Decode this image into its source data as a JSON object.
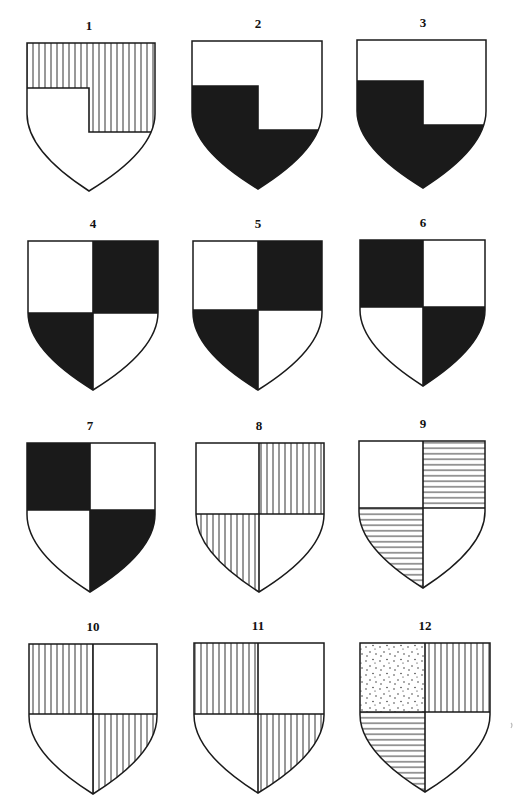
{
  "plate": {
    "ink": "#1a1a1a",
    "paper": "#ffffff",
    "figures": [
      {
        "label": "1",
        "x": 27,
        "y": 43,
        "w": 128,
        "tip": 191,
        "type": "quarter-step",
        "split_x": 89,
        "split_y": 88,
        "step_y": 132,
        "fills": {
          "top": "vertical",
          "bottom": "plain"
        }
      },
      {
        "label": "2",
        "x": 192,
        "y": 41,
        "w": 130,
        "tip": 189,
        "type": "quarter-step",
        "split_x": 258,
        "split_y": 86,
        "step_y": 130,
        "fills": {
          "top": "plain",
          "bottom": "black"
        }
      },
      {
        "label": "3",
        "x": 357,
        "y": 40,
        "w": 129,
        "tip": 188,
        "type": "quarter-step",
        "split_x": 423,
        "split_y": 81,
        "step_y": 125,
        "fills": {
          "top": "plain",
          "bottom": "black"
        }
      },
      {
        "label": "4",
        "x": 28,
        "y": 241,
        "w": 130,
        "tip": 390,
        "type": "quarterly",
        "split_x": 93,
        "split_y": 313,
        "fills": [
          "plain",
          "black",
          "black",
          "plain"
        ]
      },
      {
        "label": "5",
        "x": 193,
        "y": 241,
        "w": 129,
        "tip": 390,
        "type": "quarterly",
        "split_x": 258,
        "split_y": 310,
        "fills": [
          "plain",
          "black",
          "black",
          "plain"
        ]
      },
      {
        "label": "6",
        "x": 360,
        "y": 240,
        "w": 125,
        "tip": 386,
        "type": "quarterly",
        "split_x": 423,
        "split_y": 307,
        "fills": [
          "black",
          "plain",
          "plain",
          "black"
        ]
      },
      {
        "label": "7",
        "x": 27,
        "y": 443,
        "w": 128,
        "tip": 592,
        "type": "quarterly",
        "split_x": 90,
        "split_y": 510,
        "fills": [
          "black",
          "plain",
          "plain",
          "black"
        ]
      },
      {
        "label": "8",
        "x": 196,
        "y": 443,
        "w": 128,
        "tip": 592,
        "type": "quarterly",
        "split_x": 259,
        "split_y": 514,
        "fills": [
          "plain",
          "vertical",
          "vertical",
          "plain"
        ]
      },
      {
        "label": "9",
        "x": 359,
        "y": 441,
        "w": 126,
        "tip": 588,
        "type": "quarterly",
        "split_x": 423,
        "split_y": 508,
        "fills": [
          "plain",
          "horizontal",
          "horizontal",
          "plain"
        ]
      },
      {
        "label": "10",
        "x": 29,
        "y": 644,
        "w": 128,
        "tip": 794,
        "type": "quarterly",
        "split_x": 93,
        "split_y": 714,
        "fills": [
          "vertical",
          "plain",
          "plain",
          "vertical"
        ]
      },
      {
        "label": "11",
        "x": 194,
        "y": 643,
        "w": 130,
        "tip": 793,
        "type": "quarterly",
        "split_x": 258,
        "split_y": 714,
        "fills": [
          "vertical",
          "plain",
          "plain",
          "vertical"
        ]
      },
      {
        "label": "12",
        "x": 360,
        "y": 643,
        "w": 130,
        "tip": 792,
        "type": "quarterly",
        "split_x": 425,
        "split_y": 712,
        "fills": [
          "dotted",
          "vertical",
          "horizontal",
          "plain"
        ]
      }
    ]
  }
}
